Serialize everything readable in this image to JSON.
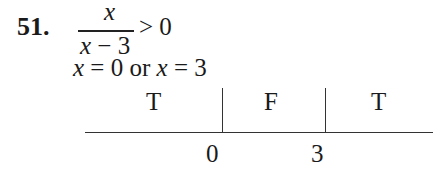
{
  "problem": {
    "number": "51.",
    "numerator": "x",
    "denominator_var": "x",
    "denominator_rest": " − 3",
    "inequality": "> 0",
    "solution_parts": [
      "x",
      " = 0 or ",
      "x",
      " = 3"
    ]
  },
  "sign_chart": {
    "intervals": [
      "T",
      "F",
      "T"
    ],
    "critical_points": [
      "0",
      "3"
    ]
  }
}
